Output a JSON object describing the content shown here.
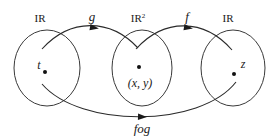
{
  "diagram": {
    "sets": [
      {
        "id": "domain-set",
        "label": "IR",
        "superscript": "",
        "element_label": "t",
        "cx": 47,
        "cy": 68,
        "rx": 33,
        "ry": 38,
        "dot_x": 45,
        "dot_y": 72,
        "label_x": 40,
        "label_y": 22,
        "elem_label_x": 40,
        "elem_label_y": 69
      },
      {
        "id": "middle-set",
        "label": "IR",
        "superscript": "2",
        "element_label": "(x, y)",
        "cx": 142,
        "cy": 68,
        "rx": 30,
        "ry": 38,
        "dot_x": 139,
        "dot_y": 67,
        "label_x": 140,
        "label_y": 22,
        "elem_label_x": 140,
        "elem_label_y": 87
      },
      {
        "id": "codomain-set",
        "label": "IR",
        "superscript": "",
        "element_label": "z",
        "cx": 233,
        "cy": 68,
        "rx": 32,
        "ry": 38,
        "dot_x": 234,
        "dot_y": 74,
        "label_x": 228,
        "label_y": 22,
        "elem_label_x": 242,
        "elem_label_y": 68
      }
    ],
    "maps": [
      {
        "id": "map-g",
        "label": "g",
        "label_x": 92,
        "label_y": 21,
        "path": "M 42 49 C 70 18, 110 18, 138 48",
        "head_x": 90,
        "head_y": 27.5,
        "head_rotation": 8
      },
      {
        "id": "map-f",
        "label": "f",
        "label_x": 187,
        "label_y": 21,
        "path": "M 136 49 C 164 18, 204 18, 232 50",
        "head_x": 185,
        "head_y": 27.5,
        "head_rotation": 8
      },
      {
        "id": "map-fog",
        "label": "fog",
        "label_x": 142,
        "label_y": 132,
        "path": "M 42 84 C 80 128, 200 128, 236 82",
        "head_x": 143,
        "head_y": 117,
        "head_rotation": 0
      }
    ]
  }
}
